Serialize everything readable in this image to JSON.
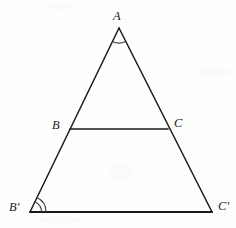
{
  "figure": {
    "canvas": {
      "width": 236,
      "height": 228,
      "background": "#fefeff"
    },
    "stroke": {
      "color": "#1a1a1d",
      "width": 1.5,
      "base_width": 2.1
    },
    "arc": {
      "color": "#3c3c40",
      "width": 1.1
    },
    "vertices": [
      {
        "id": "A",
        "name": "vertex-a",
        "label": "A",
        "x": 119,
        "y": 28,
        "label_x": 113,
        "label_y": 10
      },
      {
        "id": "B",
        "name": "vertex-b",
        "label": "B",
        "x": 70,
        "y": 129,
        "label_x": 52,
        "label_y": 119
      },
      {
        "id": "C",
        "name": "vertex-c",
        "label": "C",
        "x": 168,
        "y": 129,
        "label_x": 174,
        "label_y": 117
      },
      {
        "id": "Bp",
        "name": "vertex-b-prime",
        "label": "B'",
        "x": 30,
        "y": 212,
        "label_x": 9,
        "label_y": 201
      },
      {
        "id": "Cp",
        "name": "vertex-c-prime",
        "label": "C'",
        "x": 212,
        "y": 212,
        "label_x": 218,
        "label_y": 200
      }
    ],
    "segments": [
      {
        "name": "segment-a-bprime",
        "from": "A",
        "to": "Bp",
        "width": 1.5
      },
      {
        "name": "segment-a-cprime",
        "from": "A",
        "to": "Cp",
        "width": 1.5
      },
      {
        "name": "segment-b-c",
        "from": "B",
        "to": "C",
        "width": 1.7
      },
      {
        "name": "segment-bprime-cprime",
        "from": "Bp",
        "to": "Cp",
        "width": 2.1
      }
    ],
    "angle_marks": [
      {
        "name": "angle-mark-a",
        "vertex": "A",
        "arcs": 1,
        "radius": 15,
        "start_deg": 65,
        "end_deg": 115
      },
      {
        "name": "angle-mark-b",
        "vertex": "B",
        "arcs": 2,
        "radius": 15,
        "start_deg": 0,
        "end_deg": 64
      },
      {
        "name": "angle-mark-bprime",
        "vertex": "Bp",
        "arcs": 2,
        "radius": 16,
        "start_deg": 0,
        "end_deg": 64
      }
    ]
  }
}
